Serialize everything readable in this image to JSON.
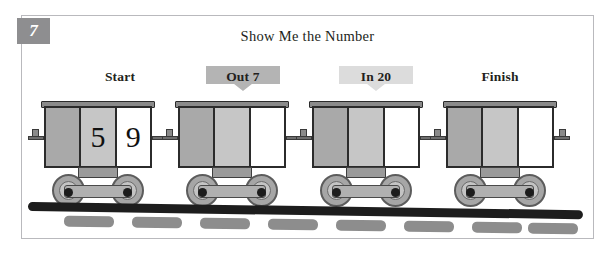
{
  "worksheet": {
    "problem_number": "7",
    "title": "Show Me the Number",
    "background_color": "#ffffff",
    "border_color": "#b9b9bd",
    "badge_color": "#8e8e90"
  },
  "labels": [
    {
      "id": "start",
      "text": "Start",
      "style": "plain"
    },
    {
      "id": "out7",
      "text": "Out 7",
      "style": "banner-dark",
      "banner_color": "#b4b4b4"
    },
    {
      "id": "in20",
      "text": "In 20",
      "style": "banner-light",
      "banner_color": "#dcdcdc"
    },
    {
      "id": "finish",
      "text": "Finish",
      "style": "plain"
    }
  ],
  "train": {
    "car_count": 4,
    "cars": [
      {
        "id": "car-1",
        "label": "Start",
        "panels": [
          {
            "fill": "dark",
            "value": ""
          },
          {
            "fill": "light",
            "value": "5"
          },
          {
            "fill": "white",
            "value": "9"
          }
        ]
      },
      {
        "id": "car-2",
        "label": "Out 7",
        "panels": [
          {
            "fill": "dark",
            "value": ""
          },
          {
            "fill": "light",
            "value": ""
          },
          {
            "fill": "white",
            "value": ""
          }
        ]
      },
      {
        "id": "car-3",
        "label": "In 20",
        "panels": [
          {
            "fill": "dark",
            "value": ""
          },
          {
            "fill": "light",
            "value": ""
          },
          {
            "fill": "white",
            "value": ""
          }
        ]
      },
      {
        "id": "car-4",
        "label": "Finish",
        "panels": [
          {
            "fill": "dark",
            "value": ""
          },
          {
            "fill": "light",
            "value": ""
          },
          {
            "fill": "white",
            "value": ""
          }
        ]
      }
    ]
  },
  "track": {
    "rail_color": "#1d1d1d",
    "tie_color": "#8d8d8d",
    "tie_count": 8
  },
  "icons": {
    "banner_pointer": "downward-pointer-icon"
  }
}
